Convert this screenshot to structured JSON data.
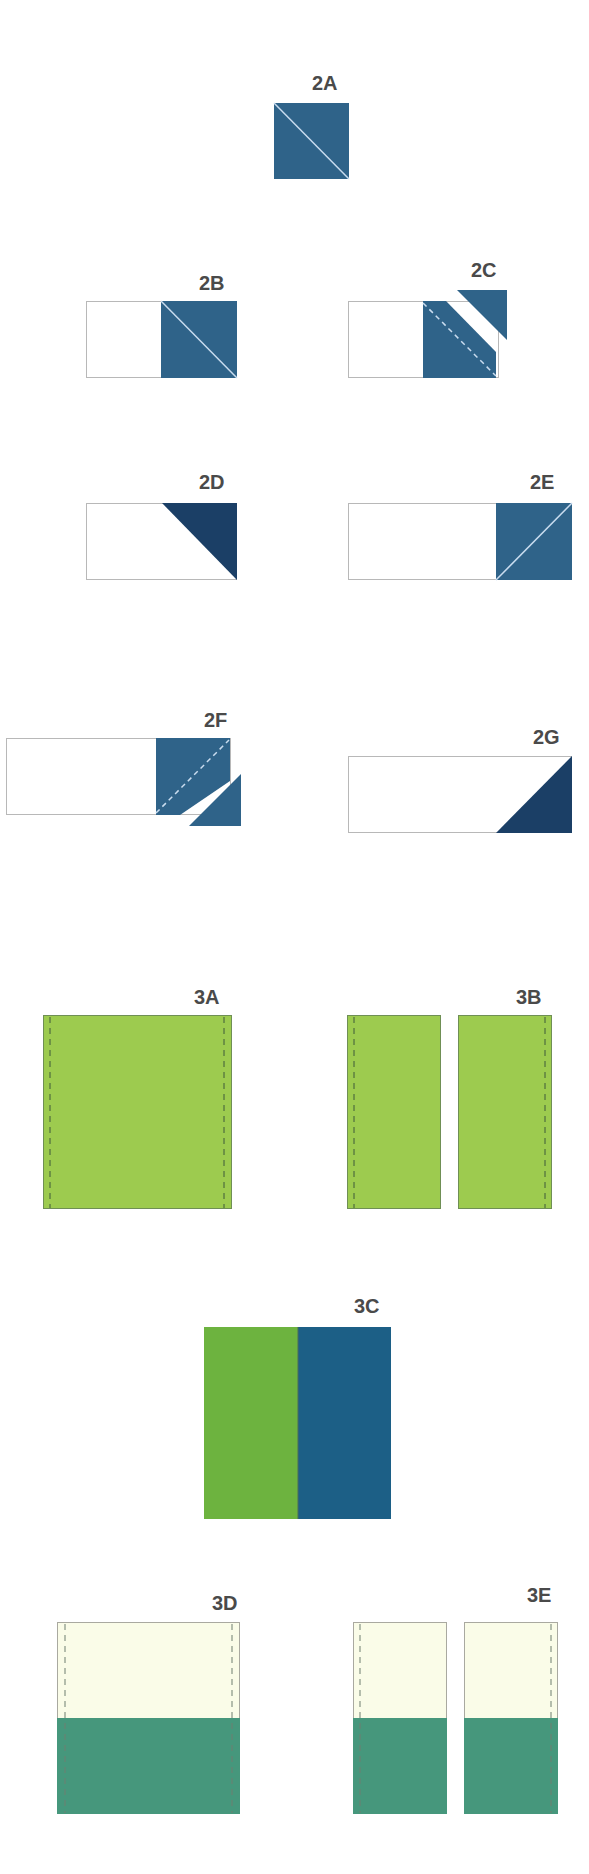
{
  "colors": {
    "background": "#ffffff",
    "outline": "#b8b8b8",
    "blue": "#2f6389",
    "navy": "#1b3f66",
    "light_green": "#9dcb4f",
    "green": "#6db33f",
    "teal_blue": "#1c5f86",
    "cream": "#fafce8",
    "teal": "#46977c",
    "seam_light": "#c9dcef",
    "seam_dark": "#3f5a3a",
    "label": "#4a4a4a"
  },
  "steps": [
    {
      "id": "2A",
      "label": "2A",
      "label_pos": [
        312,
        90
      ]
    },
    {
      "id": "2B",
      "label": "2B",
      "label_pos": [
        199,
        290
      ]
    },
    {
      "id": "2C",
      "label": "2C",
      "label_pos": [
        471,
        277
      ]
    },
    {
      "id": "2D",
      "label": "2D",
      "label_pos": [
        199,
        489
      ]
    },
    {
      "id": "2E",
      "label": "2E",
      "label_pos": [
        530,
        489
      ]
    },
    {
      "id": "2F",
      "label": "2F",
      "label_pos": [
        204,
        727
      ]
    },
    {
      "id": "2G",
      "label": "2G",
      "label_pos": [
        533,
        744
      ]
    },
    {
      "id": "3A",
      "label": "3A",
      "label_pos": [
        194,
        1004
      ]
    },
    {
      "id": "3B",
      "label": "3B",
      "label_pos": [
        516,
        1004
      ]
    },
    {
      "id": "3C",
      "label": "3C",
      "label_pos": [
        354,
        1313
      ]
    },
    {
      "id": "3D",
      "label": "3D",
      "label_pos": [
        212,
        1610
      ]
    },
    {
      "id": "3E",
      "label": "3E",
      "label_pos": [
        527,
        1602
      ]
    }
  ]
}
